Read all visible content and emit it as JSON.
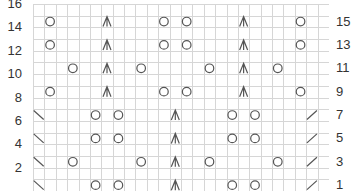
{
  "chart": {
    "columns": 26,
    "rows": 16,
    "grid_color": "#d6d6d6",
    "symbol_color": "#555555",
    "left_labels": [
      "2",
      "4",
      "6",
      "8",
      "10",
      "12",
      "14",
      "16"
    ],
    "right_labels": [
      "1",
      "3",
      "5",
      "7",
      "9",
      "11",
      "13",
      "15"
    ],
    "legend": {
      "O": "yarn-over",
      "A": "central-double-decrease",
      "\\": "ssk-decrease",
      "/": "k2tog-decrease"
    },
    "stitches": [
      {
        "row": 15,
        "col": 2,
        "sym": "O"
      },
      {
        "row": 15,
        "col": 7,
        "sym": "A"
      },
      {
        "row": 15,
        "col": 12,
        "sym": "O"
      },
      {
        "row": 15,
        "col": 14,
        "sym": "O"
      },
      {
        "row": 15,
        "col": 19,
        "sym": "A"
      },
      {
        "row": 15,
        "col": 24,
        "sym": "O"
      },
      {
        "row": 13,
        "col": 2,
        "sym": "O"
      },
      {
        "row": 13,
        "col": 7,
        "sym": "A"
      },
      {
        "row": 13,
        "col": 12,
        "sym": "O"
      },
      {
        "row": 13,
        "col": 14,
        "sym": "O"
      },
      {
        "row": 13,
        "col": 19,
        "sym": "A"
      },
      {
        "row": 13,
        "col": 24,
        "sym": "O"
      },
      {
        "row": 11,
        "col": 4,
        "sym": "O"
      },
      {
        "row": 11,
        "col": 7,
        "sym": "A"
      },
      {
        "row": 11,
        "col": 10,
        "sym": "O"
      },
      {
        "row": 11,
        "col": 16,
        "sym": "O"
      },
      {
        "row": 11,
        "col": 19,
        "sym": "A"
      },
      {
        "row": 11,
        "col": 22,
        "sym": "O"
      },
      {
        "row": 9,
        "col": 2,
        "sym": "O"
      },
      {
        "row": 9,
        "col": 7,
        "sym": "A"
      },
      {
        "row": 9,
        "col": 12,
        "sym": "O"
      },
      {
        "row": 9,
        "col": 14,
        "sym": "O"
      },
      {
        "row": 9,
        "col": 19,
        "sym": "A"
      },
      {
        "row": 9,
        "col": 24,
        "sym": "O"
      },
      {
        "row": 7,
        "col": 1,
        "sym": "\\"
      },
      {
        "row": 7,
        "col": 6,
        "sym": "O"
      },
      {
        "row": 7,
        "col": 8,
        "sym": "O"
      },
      {
        "row": 7,
        "col": 13,
        "sym": "A"
      },
      {
        "row": 7,
        "col": 18,
        "sym": "O"
      },
      {
        "row": 7,
        "col": 20,
        "sym": "O"
      },
      {
        "row": 7,
        "col": 25,
        "sym": "/"
      },
      {
        "row": 5,
        "col": 1,
        "sym": "\\"
      },
      {
        "row": 5,
        "col": 6,
        "sym": "O"
      },
      {
        "row": 5,
        "col": 8,
        "sym": "O"
      },
      {
        "row": 5,
        "col": 13,
        "sym": "A"
      },
      {
        "row": 5,
        "col": 18,
        "sym": "O"
      },
      {
        "row": 5,
        "col": 20,
        "sym": "O"
      },
      {
        "row": 5,
        "col": 25,
        "sym": "/"
      },
      {
        "row": 3,
        "col": 1,
        "sym": "\\"
      },
      {
        "row": 3,
        "col": 4,
        "sym": "O"
      },
      {
        "row": 3,
        "col": 10,
        "sym": "O"
      },
      {
        "row": 3,
        "col": 13,
        "sym": "A"
      },
      {
        "row": 3,
        "col": 16,
        "sym": "O"
      },
      {
        "row": 3,
        "col": 22,
        "sym": "O"
      },
      {
        "row": 3,
        "col": 25,
        "sym": "/"
      },
      {
        "row": 1,
        "col": 1,
        "sym": "\\"
      },
      {
        "row": 1,
        "col": 6,
        "sym": "O"
      },
      {
        "row": 1,
        "col": 8,
        "sym": "O"
      },
      {
        "row": 1,
        "col": 13,
        "sym": "A"
      },
      {
        "row": 1,
        "col": 18,
        "sym": "O"
      },
      {
        "row": 1,
        "col": 20,
        "sym": "O"
      },
      {
        "row": 1,
        "col": 25,
        "sym": "/"
      }
    ]
  }
}
